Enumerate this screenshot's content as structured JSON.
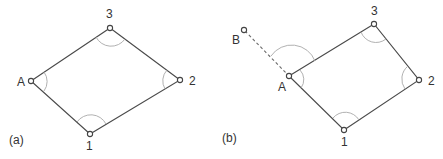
{
  "figures": [
    {
      "id": "a",
      "caption": "(a)",
      "caption_pos": [
        9,
        146
      ],
      "nodes": [
        {
          "label": "A",
          "x": 31,
          "y": 81,
          "lx": 17,
          "ly": 86
        },
        {
          "label": "3",
          "x": 110,
          "y": 28,
          "lx": 106,
          "ly": 18
        },
        {
          "label": "2",
          "x": 180,
          "y": 80,
          "lx": 189,
          "ly": 85
        },
        {
          "label": "1",
          "x": 90,
          "y": 134,
          "lx": 86,
          "ly": 150
        }
      ],
      "polygon_order": [
        "A",
        "3",
        "2",
        "1"
      ]
    },
    {
      "id": "b",
      "caption": "(b)",
      "caption_pos": [
        222,
        142
      ],
      "nodes": [
        {
          "label": "A",
          "x": 289,
          "y": 76,
          "lx": 278,
          "ly": 91
        },
        {
          "label": "3",
          "x": 374,
          "y": 24,
          "lx": 371,
          "ly": 15
        },
        {
          "label": "2",
          "x": 419,
          "y": 80,
          "lx": 428,
          "ly": 85
        },
        {
          "label": "1",
          "x": 344,
          "y": 130,
          "lx": 341,
          "ly": 146
        },
        {
          "label": "B",
          "x": 244,
          "y": 30,
          "lx": 232,
          "ly": 44
        }
      ],
      "polygon_order": [
        "A",
        "3",
        "2",
        "1"
      ],
      "dashed_line": [
        "B",
        "A"
      ]
    }
  ]
}
